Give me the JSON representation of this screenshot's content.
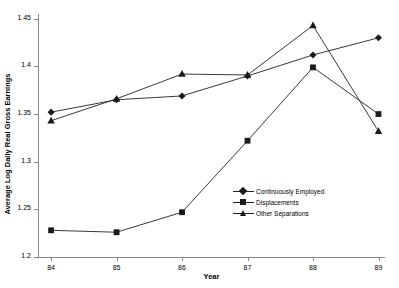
{
  "chart_data": {
    "type": "line",
    "title": "",
    "xlabel": "Year",
    "ylabel": "Average Log Daily Real Gross Earnings",
    "x": [
      84,
      85,
      86,
      87,
      88,
      89
    ],
    "xtick_labels": [
      "84",
      "85",
      "86",
      "87",
      "88",
      "89"
    ],
    "ytick_labels": [
      "1.2",
      "1.25",
      "1.3",
      "1.35",
      "1.4",
      "1.45"
    ],
    "ytick_values": [
      1.2,
      1.25,
      1.3,
      1.35,
      1.4,
      1.45
    ],
    "xlim": [
      83.8,
      89.1
    ],
    "ylim": [
      1.2,
      1.455
    ],
    "grid": false,
    "legend_position": "inside-lower-right",
    "series": [
      {
        "name": "Continuously Employed",
        "marker": "diamond",
        "values": [
          1.352,
          1.365,
          1.369,
          1.39,
          1.412,
          1.43
        ]
      },
      {
        "name": "Displacements",
        "marker": "square",
        "values": [
          1.228,
          1.226,
          1.247,
          1.322,
          1.399,
          1.35
        ]
      },
      {
        "name": "Other Separations",
        "marker": "triangle",
        "values": [
          1.343,
          1.366,
          1.392,
          1.391,
          1.443,
          1.332
        ]
      }
    ]
  },
  "legend": {
    "items": [
      {
        "label": "Continuously Employed",
        "marker": "diamond"
      },
      {
        "label": "Displacements",
        "marker": "square"
      },
      {
        "label": "Other Separations",
        "marker": "triangle"
      }
    ]
  },
  "colors": {
    "line": "#222222",
    "marker": "#1a1a1a",
    "axis": "#8a8a8a",
    "text": "#000000",
    "background": "#ffffff"
  }
}
